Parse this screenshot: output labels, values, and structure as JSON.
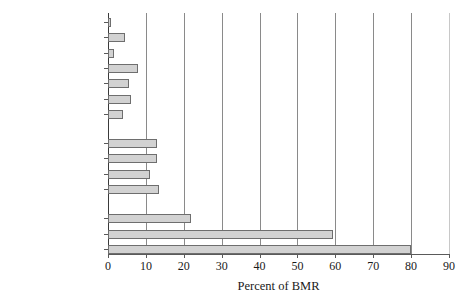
{
  "chart_data": {
    "type": "bar",
    "orientation": "horizontal",
    "title": "",
    "xlabel": "Percent of BMR",
    "ylabel": "",
    "xlim": [
      0,
      90
    ],
    "xticks": [
      0,
      10,
      20,
      30,
      40,
      50,
      60,
      70,
      80,
      90
    ],
    "grid": "vertical",
    "legend": "none",
    "bar_fill_color": "#d2d2d2",
    "bar_edge_color": "#6e6e6e",
    "categories": [
      "Fin whale",
      "Dolphin",
      "Horse",
      "Mouse",
      "Rat",
      "Rabbit",
      "Dog",
      "Macaque",
      "Baboon",
      "Orangutan",
      "Chimpanzee",
      "Adult human",
      "Elephant nose fish",
      "Baby human"
    ],
    "values": [
      0.5,
      4.5,
      1.5,
      8,
      5.5,
      6,
      4,
      13,
      13,
      11,
      13.5,
      22,
      59.5,
      80
    ],
    "groups": [
      {
        "name": "non-primate mammals",
        "members": [
          "Fin whale",
          "Dolphin",
          "Horse",
          "Mouse",
          "Rat",
          "Rabbit",
          "Dog"
        ]
      },
      {
        "name": "primates",
        "members": [
          "Macaque",
          "Baboon",
          "Orangutan",
          "Chimpanzee"
        ]
      },
      {
        "name": "high BMR brains",
        "members": [
          "Adult human",
          "Elephant nose fish",
          "Baby human"
        ]
      }
    ]
  }
}
